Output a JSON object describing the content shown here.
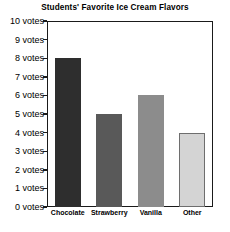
{
  "chart_data": {
    "type": "bar",
    "title": "Students' Favorite Ice Cream Flavors",
    "xlabel": "",
    "ylabel": "",
    "categories": [
      "Chocolate",
      "Strawberry",
      "Vanilla",
      "Other"
    ],
    "values": [
      8,
      5,
      6,
      4
    ],
    "bar_colors": [
      "#2e2e2e",
      "#595959",
      "#8c8c8c",
      "#d4d4d4"
    ],
    "bar_border_colors": [
      "#2e2e2e",
      "#595959",
      "#8c8c8c",
      "#6e6e6e"
    ],
    "ylim": [
      0,
      10
    ],
    "ytick_values": [
      10,
      9,
      8,
      7,
      6,
      5,
      4,
      3,
      2,
      1,
      0
    ],
    "ytick_labels": [
      "10 votes",
      "9 votes",
      "8 votes",
      "7 votes",
      "6 votes",
      "5 votes",
      "4 votes",
      "3 votes",
      "2 votes",
      "1 votes",
      "0 votes"
    ],
    "grid": false,
    "legend": null,
    "frame_color": "#1a1a1a",
    "background_color": "#ffffff"
  }
}
